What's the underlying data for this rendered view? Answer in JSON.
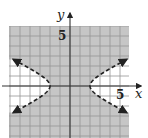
{
  "chart_data": {
    "type": "inequality-graph",
    "title": "",
    "xlabel": "x",
    "ylabel": "y",
    "xlim": [
      -6,
      6
    ],
    "ylim": [
      -5.2,
      6
    ],
    "grid": true,
    "grid_step": 1,
    "tick_labels": {
      "x": [
        {
          "value": 5,
          "label": "5"
        }
      ],
      "y": [
        {
          "value": 5,
          "label": "5"
        }
      ]
    },
    "boundary": {
      "equation": "x^2/4 - y^2 = 1",
      "curve": "hyperbola",
      "vertices": [
        [
          -2,
          0
        ],
        [
          2,
          0
        ]
      ],
      "style": "dashed",
      "arrows": true
    },
    "shaded_region": "x^2/4 - y^2 < 1",
    "inequality": "x^2/4 - y^2 < 1",
    "colors": {
      "shade": "#c6c6c6",
      "grid": "#969696",
      "axis": "#333333",
      "curve": "#222222",
      "unshaded": "#ffffff"
    }
  },
  "labels": {
    "x_axis": "x",
    "y_axis": "y",
    "x_tick": "5",
    "y_tick": "5"
  }
}
